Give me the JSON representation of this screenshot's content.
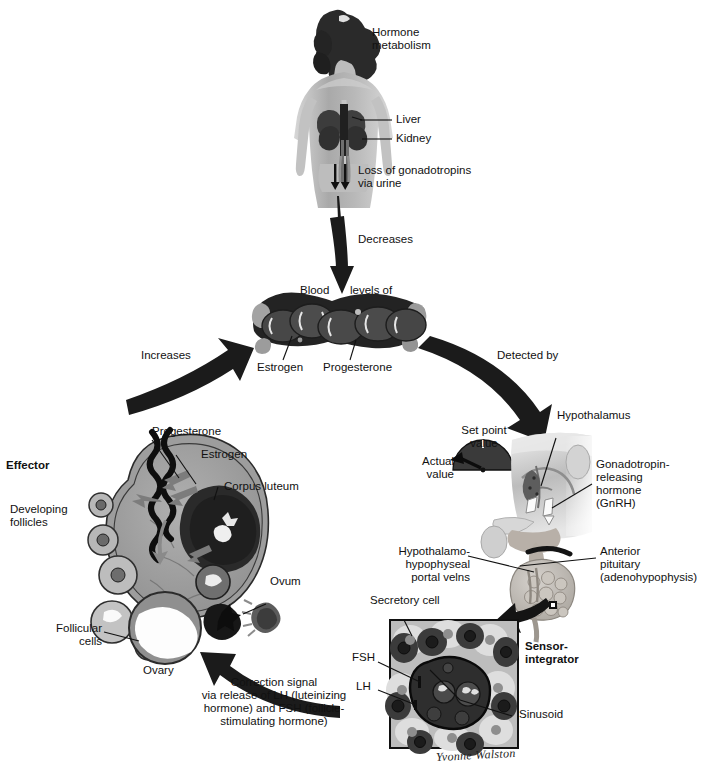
{
  "figure": {
    "kind": "physiology-feedback-loop-diagram",
    "palette": {
      "ink": "#111111",
      "arrow": "#1b1b1b",
      "mid_gray": "#8a8a8a",
      "dark_gray": "#4a4a4a",
      "light_gray": "#c9c9c9",
      "pale": "#e4e4e4",
      "white": "#ffffff"
    },
    "signature": "Yvonne Walston"
  },
  "labels": {
    "hormone_metabolism": "Hormone\nmetabolism",
    "liver": "Liver",
    "kidney": "Kidney",
    "loss_gonadotropins": "Loss of gonadotropins\nvia urine",
    "decreases": "Decreases",
    "blood": "Blood",
    "levels_of": "levels of",
    "estrogen_blood": "Estrogen",
    "progesterone_blood": "Progesterone",
    "increases": "Increases",
    "detected_by": "Detected by",
    "effector": "Effector",
    "progesterone_ovary": "Progesterone",
    "estrogen_ovary": "Estrogen",
    "corpus_luteum": "Corpus luteum",
    "developing_follicles": "Developing\nfollicles",
    "follicular_cells": "Follicular\ncells",
    "ovum": "Ovum",
    "ovary": "Ovary",
    "set_point_value": "Set point\nvalue",
    "actual_value": "Actual\nvalue",
    "hypothalamus": "Hypothalamus",
    "gnrh": "Gonadotropin-\nreleasing\nhormone\n(GnRH)",
    "portal_veins": "Hypothalamo-\nhypophyseal\nportal velns",
    "anterior_pituitary": "Anterior\npituitary\n(adenohypophysis)",
    "secretory_cell": "Secretory cell",
    "fsh": "FSH",
    "lh": "LH",
    "sinusoid": "Sinusoid",
    "sensor_integrator": "Sensor-\nintegrator",
    "correction_signal": "Correction signal\nvia release of LH (luteinizing\nhormone) and FSH (follicle-\nstimulating hormone)"
  }
}
